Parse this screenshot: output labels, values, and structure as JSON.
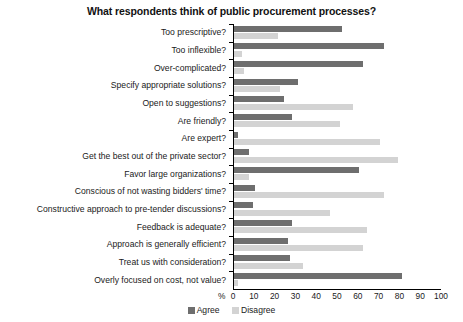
{
  "chart_data": {
    "type": "bar",
    "orientation": "horizontal",
    "title": "What respondents think of public procurement processes?",
    "xlabel": "%",
    "ylabel": "",
    "xlim": [
      0,
      100
    ],
    "xticks": [
      0,
      10,
      20,
      30,
      40,
      50,
      60,
      70,
      80,
      90,
      100
    ],
    "grid": false,
    "legend_position": "bottom-center",
    "categories": [
      "Too prescriptive?",
      "Too inflexible?",
      "Over-complicated?",
      "Specify appropriate solutions?",
      "Open to suggestions?",
      "Are friendly?",
      "Are expert?",
      "Get the best out of the private sector?",
      "Favor large organizations?",
      "Conscious of not wasting bidders' time?",
      "Constructive approach to pre-tender discussions?",
      "Feedback is adequate?",
      "Approach is generally efficient?",
      "Treat us with consideration?",
      "Overly focused on cost, not value?"
    ],
    "series": [
      {
        "name": "Agree",
        "color": "#6e6e6e",
        "values": [
          52,
          72,
          62,
          31,
          24,
          28,
          2,
          7,
          60,
          10,
          9,
          28,
          26,
          27,
          81
        ]
      },
      {
        "name": "Disagree",
        "color": "#d3d3d3",
        "values": [
          21,
          4,
          5,
          22,
          57,
          51,
          70,
          79,
          7,
          72,
          46,
          64,
          62,
          33,
          2
        ]
      }
    ]
  },
  "legend": {
    "items": [
      {
        "label": "Agree",
        "swatch": "agree-swatch"
      },
      {
        "label": "Disagree",
        "swatch": "disagree-swatch"
      }
    ]
  }
}
